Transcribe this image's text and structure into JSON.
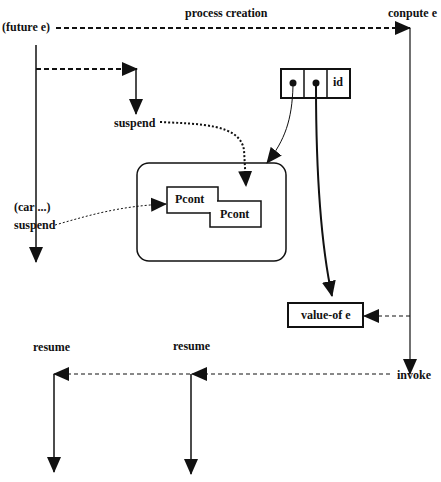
{
  "diagram": {
    "labels": {
      "future": "(future e)",
      "process_creation": "process creation",
      "compute": "conpute e",
      "suspend_top": "suspend",
      "car": "(car ...)",
      "suspend_left": "suspend",
      "invoke": "invoke",
      "resume_left": "resume",
      "resume_mid": "resume"
    },
    "boxes": {
      "future_record": {
        "cells": [
          "",
          "",
          "id"
        ]
      },
      "pcont_1": "Pcont",
      "pcont_2": "Pcont",
      "value_of": "value-of e"
    },
    "colors": {
      "stroke": "#111111",
      "background": "#ffffff"
    }
  }
}
